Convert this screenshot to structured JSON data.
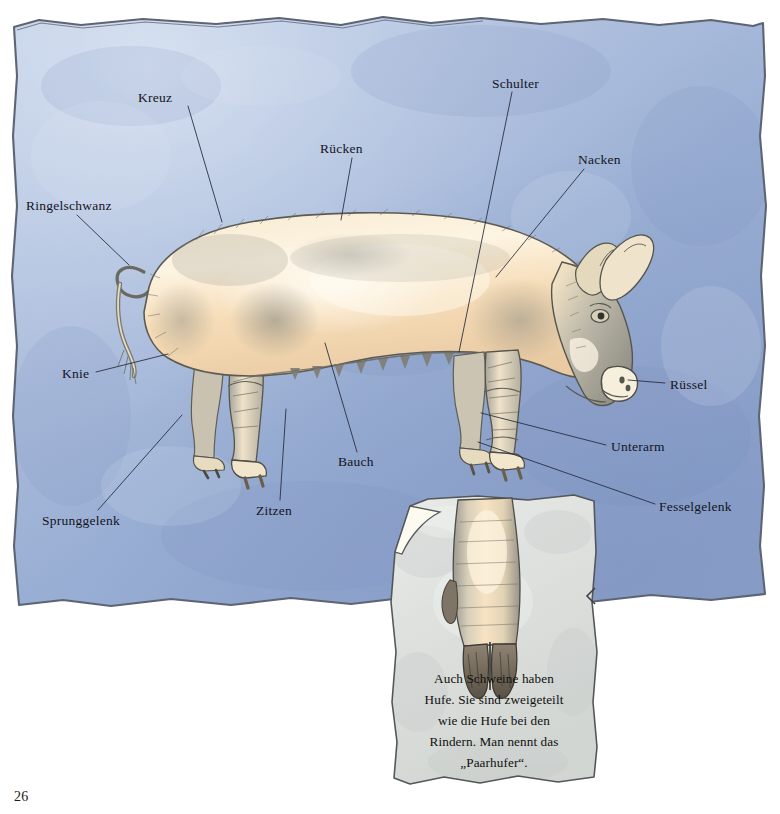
{
  "page": {
    "number": "26",
    "background_color": "#ffffff",
    "paper_color_light": "#c8d6ea",
    "paper_color_mid": "#93a8cf",
    "paper_color_dark": "#8094c0",
    "note_color": "#dde0de",
    "pig_body_color": "#f6e0bd",
    "pig_shade_color": "#8b8c85",
    "ink_color": "#1b2330"
  },
  "subject": {
    "title": "Schwein - Körperteile",
    "illustration_name": "pig-side-view-illustration",
    "inset_name": "cloven-hoof-illustration"
  },
  "labels": [
    {
      "id": "kreuz",
      "text": "Kreuz",
      "x": 138,
      "y": 91,
      "leader": [
        188,
        106,
        222,
        222
      ]
    },
    {
      "id": "schulter",
      "text": "Schulter",
      "x": 492,
      "y": 77,
      "leader": [
        512,
        92,
        459,
        352
      ]
    },
    {
      "id": "ruecken",
      "text": "Rücken",
      "x": 320,
      "y": 142,
      "leader": [
        352,
        158,
        341,
        220
      ]
    },
    {
      "id": "nacken",
      "text": "Nacken",
      "x": 578,
      "y": 153,
      "leader": [
        584,
        169,
        496,
        277
      ]
    },
    {
      "id": "ringelschwanz",
      "text": "Ringelschwanz",
      "x": 26,
      "y": 199,
      "leader": [
        77,
        215,
        129,
        265
      ]
    },
    {
      "id": "knie",
      "text": "Knie",
      "x": 62,
      "y": 367,
      "leader": [
        96,
        372,
        168,
        354
      ]
    },
    {
      "id": "ruessel",
      "text": "Rüssel",
      "x": 670,
      "y": 378,
      "leader": [
        665,
        383,
        628,
        380
      ]
    },
    {
      "id": "unterarm",
      "text": "Unterarm",
      "x": 611,
      "y": 440,
      "leader": [
        606,
        445,
        481,
        413
      ]
    },
    {
      "id": "bauch",
      "text": "Bauch",
      "x": 338,
      "y": 455,
      "leader": [
        357,
        452,
        325,
        343
      ]
    },
    {
      "id": "fesselgelenk",
      "text": "Fesselgelenk",
      "x": 659,
      "y": 500,
      "leader": [
        655,
        504,
        478,
        442
      ]
    },
    {
      "id": "zitzen",
      "text": "Zitzen",
      "x": 256,
      "y": 504,
      "leader": [
        280,
        500,
        286,
        409
      ]
    },
    {
      "id": "sprunggelenk",
      "text": "Sprunggelenk",
      "x": 42,
      "y": 514,
      "leader": [
        98,
        510,
        182,
        415
      ]
    }
  ],
  "note": {
    "name": "cloven-hoof-note",
    "lines": [
      "Auch Schweine haben",
      "Hufe. Sie sind zweigeteilt",
      "wie die Hufe bei den",
      "Rindern. Man nennt das",
      "„Paarhufer“."
    ],
    "full_text": "Auch Schweine haben Hufe. Sie sind zweigeteilt wie die Hufe bei den Rindern. Man nennt das „Paarhufer“."
  }
}
